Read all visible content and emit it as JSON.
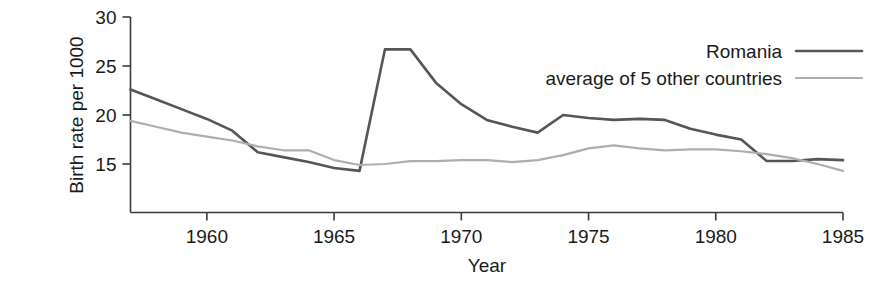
{
  "chart_data": {
    "type": "line",
    "title": "",
    "xlabel": "Year",
    "ylabel": "Birth rate per 1000",
    "xlim": [
      1957,
      1985
    ],
    "ylim": [
      12.5,
      30
    ],
    "yticks": [
      15,
      20,
      25,
      30
    ],
    "ytick_labels": [
      "15",
      "20",
      "25",
      "30"
    ],
    "xticks": [
      1960,
      1965,
      1970,
      1975,
      1980,
      1985
    ],
    "xtick_labels": [
      "1960",
      "1965",
      "1970",
      "1975",
      "1980",
      "1985"
    ],
    "grid": false,
    "legend_position": "top-right",
    "x": [
      1957,
      1958,
      1959,
      1960,
      1961,
      1962,
      1963,
      1964,
      1965,
      1966,
      1967,
      1968,
      1969,
      1970,
      1971,
      1972,
      1973,
      1974,
      1975,
      1976,
      1977,
      1978,
      1979,
      1980,
      1981,
      1982,
      1983,
      1984,
      1985
    ],
    "series": [
      {
        "name": "Romania",
        "color": "#565656",
        "width": 2.6,
        "values": [
          22.6,
          21.6,
          20.6,
          19.6,
          18.4,
          16.2,
          15.7,
          15.2,
          14.6,
          14.3,
          26.7,
          26.7,
          23.3,
          21.1,
          19.5,
          18.8,
          18.2,
          20.0,
          19.7,
          19.5,
          19.6,
          19.5,
          18.6,
          18.0,
          17.5,
          15.3,
          15.3,
          15.5,
          15.4
        ]
      },
      {
        "name": "average of 5 other countries",
        "color": "#aeaeae",
        "width": 2.2,
        "values": [
          19.4,
          18.8,
          18.2,
          17.8,
          17.4,
          16.8,
          16.4,
          16.4,
          15.4,
          14.9,
          15.0,
          15.3,
          15.3,
          15.4,
          15.4,
          15.2,
          15.4,
          15.9,
          16.6,
          16.9,
          16.6,
          16.4,
          16.5,
          16.5,
          16.3,
          16.0,
          15.6,
          15.0,
          14.3
        ]
      }
    ]
  },
  "legend": {
    "entries": [
      {
        "label": "Romania"
      },
      {
        "label": "average of 5 other countries"
      }
    ]
  }
}
